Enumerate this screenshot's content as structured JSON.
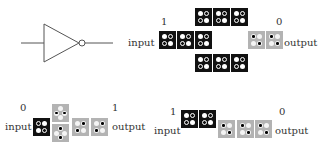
{
  "gate": {
    "symbol": "NOT gate",
    "stroke_color": "#555555"
  },
  "colors": {
    "black_tile": "#111111",
    "gray_tile": "#b3b3b3",
    "dot": "#ffffff",
    "pin": "#000000"
  },
  "panels": [
    {
      "id": "top-right",
      "input_label": "input",
      "input_value": "1",
      "output_label": "output",
      "output_value": "0"
    },
    {
      "id": "bottom-left",
      "input_label": "input",
      "input_value": "0",
      "output_label": "output",
      "output_value": "1"
    },
    {
      "id": "bottom-right",
      "input_label": "input",
      "input_value": "1",
      "output_label": "output",
      "output_value": "0"
    }
  ]
}
